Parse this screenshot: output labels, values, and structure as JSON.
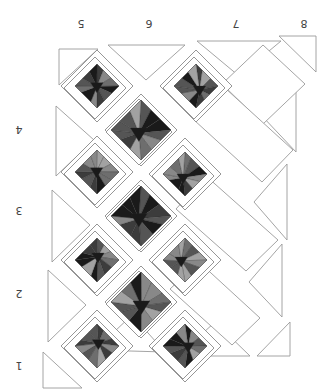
{
  "diagram": {
    "type": "quilt-layout",
    "orientation": "rotated-180",
    "column_labels": [
      {
        "text": "5",
        "x": 81,
        "y": 23
      },
      {
        "text": "6",
        "x": 149,
        "y": 23
      },
      {
        "text": "7",
        "x": 236,
        "y": 23
      },
      {
        "text": "8",
        "x": 304,
        "y": 23
      }
    ],
    "row_labels": [
      {
        "text": "4",
        "x": 19,
        "y": 129
      },
      {
        "text": "3",
        "x": 19,
        "y": 210
      },
      {
        "text": "2",
        "x": 19,
        "y": 293
      },
      {
        "text": "1",
        "x": 19,
        "y": 365
      }
    ],
    "colors": {
      "background": "#ffffff",
      "outline": "#9a9a9a",
      "block_shades": [
        "#1a1a1a",
        "#3c3c3c",
        "#555555",
        "#6e6e6e",
        "#888888",
        "#a2a2a2"
      ]
    },
    "pieced_blocks": [
      {
        "cx": 97,
        "cy": 86,
        "r": 22,
        "frame": 34,
        "size": "small"
      },
      {
        "cx": 196,
        "cy": 86,
        "r": 22,
        "frame": 34,
        "size": "small"
      },
      {
        "cx": 141,
        "cy": 130,
        "r": 30,
        "frame": 30,
        "size": "large"
      },
      {
        "cx": 97,
        "cy": 172,
        "r": 22,
        "frame": 34,
        "size": "small"
      },
      {
        "cx": 185,
        "cy": 174,
        "r": 22,
        "frame": 34,
        "size": "small"
      },
      {
        "cx": 141,
        "cy": 216,
        "r": 30,
        "frame": 30,
        "size": "large"
      },
      {
        "cx": 97,
        "cy": 260,
        "r": 22,
        "frame": 34,
        "size": "small"
      },
      {
        "cx": 185,
        "cy": 260,
        "r": 22,
        "frame": 34,
        "size": "small"
      },
      {
        "cx": 141,
        "cy": 302,
        "r": 30,
        "frame": 30,
        "size": "large"
      },
      {
        "cx": 97,
        "cy": 346,
        "r": 22,
        "frame": 34,
        "size": "small"
      },
      {
        "cx": 185,
        "cy": 346,
        "r": 22,
        "frame": 34,
        "size": "small"
      }
    ],
    "plain_squares": [
      {
        "points": "263,45 305,84 263,124 222,84"
      },
      {
        "points": "225,88 293,150 262,182 194,120"
      },
      {
        "points": "206,176 278,240 246,271 176,209"
      },
      {
        "points": "199,262 260,318 232,345 170,289"
      }
    ],
    "setting_triangles": [
      {
        "points": "59,49 98,49 59,85"
      },
      {
        "points": "108,45 185,45 146,80"
      },
      {
        "points": "197,41 281,41 239,76"
      },
      {
        "points": "279,36 316,36 316,72"
      },
      {
        "points": "56,106 94,140 56,176"
      },
      {
        "points": "52,190 90,225 52,262"
      },
      {
        "points": "48,270 86,305 48,342"
      },
      {
        "points": "43,352 82,388 43,388"
      },
      {
        "points": "95,350 132,315 165,352"
      },
      {
        "points": "178,356 215,322 250,356"
      },
      {
        "points": "257,356 290,322 290,356"
      },
      {
        "points": "296,82 296,152 262,116"
      },
      {
        "points": "287,164 287,240 254,202"
      },
      {
        "points": "282,244 282,317 249,282"
      }
    ]
  }
}
